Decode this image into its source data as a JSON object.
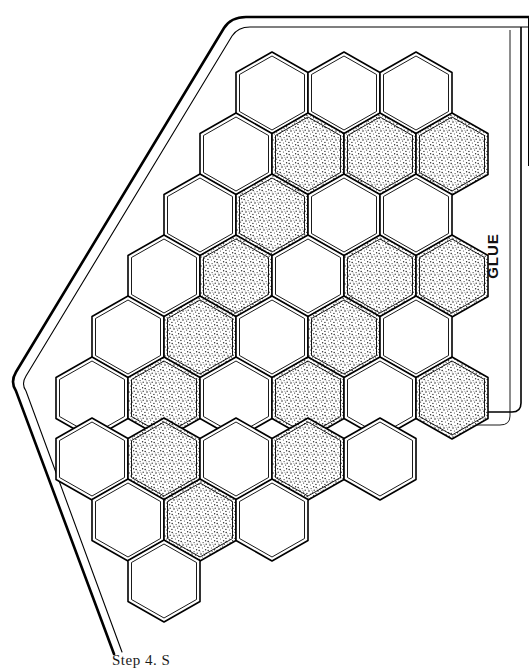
{
  "figure": {
    "glue_label": "GLUE",
    "caption": "Step 4. S",
    "line_color": "#000000",
    "paper_color": "#ffffff",
    "shade_color": "#e8e8e8"
  },
  "backing": {
    "name": "fabric-backing-outline",
    "style": "double line with rounded corners",
    "stroke_outer": 2.6,
    "stroke_inner": 1.1
  },
  "grid": {
    "shape": "pointy-top-hexagon",
    "hex_width": 72,
    "hex_height": 82,
    "row_step": 61,
    "col_step": 72,
    "rows": [
      {
        "index": 1,
        "origin_x": 236,
        "origin_y": 52,
        "cells": [
          {
            "id": "r1c1",
            "fill": "white"
          },
          {
            "id": "r1c2",
            "fill": "white"
          },
          {
            "id": "r1c3",
            "fill": "white"
          }
        ]
      },
      {
        "index": 2,
        "origin_x": 200,
        "origin_y": 113,
        "cells": [
          {
            "id": "r2c1",
            "fill": "white"
          },
          {
            "id": "r2c2",
            "fill": "shaded"
          },
          {
            "id": "r2c3",
            "fill": "shaded"
          },
          {
            "id": "r2c4",
            "fill": "shaded"
          }
        ]
      },
      {
        "index": 3,
        "origin_x": 164,
        "origin_y": 174,
        "cells": [
          {
            "id": "r3c1",
            "fill": "white"
          },
          {
            "id": "r3c2",
            "fill": "shaded"
          },
          {
            "id": "r3c3",
            "fill": "white"
          },
          {
            "id": "r3c4",
            "fill": "white"
          }
        ]
      },
      {
        "index": 4,
        "origin_x": 128,
        "origin_y": 235,
        "cells": [
          {
            "id": "r4c1",
            "fill": "white"
          },
          {
            "id": "r4c2",
            "fill": "shaded"
          },
          {
            "id": "r4c3",
            "fill": "white"
          },
          {
            "id": "r4c4",
            "fill": "shaded"
          },
          {
            "id": "r4c5",
            "fill": "shaded"
          }
        ]
      },
      {
        "index": 5,
        "origin_x": 92,
        "origin_y": 296,
        "cells": [
          {
            "id": "r5c1",
            "fill": "white"
          },
          {
            "id": "r5c2",
            "fill": "shaded"
          },
          {
            "id": "r5c3",
            "fill": "white"
          },
          {
            "id": "r5c4",
            "fill": "shaded"
          },
          {
            "id": "r5c5",
            "fill": "white"
          }
        ]
      },
      {
        "index": 6,
        "origin_x": 56,
        "origin_y": 357,
        "cells": [
          {
            "id": "r6c1",
            "fill": "white"
          },
          {
            "id": "r6c2",
            "fill": "shaded"
          },
          {
            "id": "r6c3",
            "fill": "white"
          },
          {
            "id": "r6c4",
            "fill": "shaded"
          },
          {
            "id": "r6c5",
            "fill": "white"
          },
          {
            "id": "r6c6",
            "fill": "shaded"
          }
        ]
      },
      {
        "index": 7,
        "origin_x": 56,
        "origin_y": 418,
        "cells": [
          {
            "id": "r7c1",
            "fill": "white"
          },
          {
            "id": "r7c2",
            "fill": "shaded"
          },
          {
            "id": "r7c3",
            "fill": "white"
          },
          {
            "id": "r7c4",
            "fill": "shaded"
          },
          {
            "id": "r7c5",
            "fill": "white"
          }
        ]
      },
      {
        "index": 8,
        "origin_x": 92,
        "origin_y": 479,
        "cells": [
          {
            "id": "r8c1",
            "fill": "white"
          },
          {
            "id": "r8c2",
            "fill": "shaded"
          },
          {
            "id": "r8c3",
            "fill": "white"
          }
        ]
      },
      {
        "index": 9,
        "origin_x": 128,
        "origin_y": 540,
        "cells": [
          {
            "id": "r9c1",
            "fill": "white"
          }
        ]
      }
    ]
  }
}
